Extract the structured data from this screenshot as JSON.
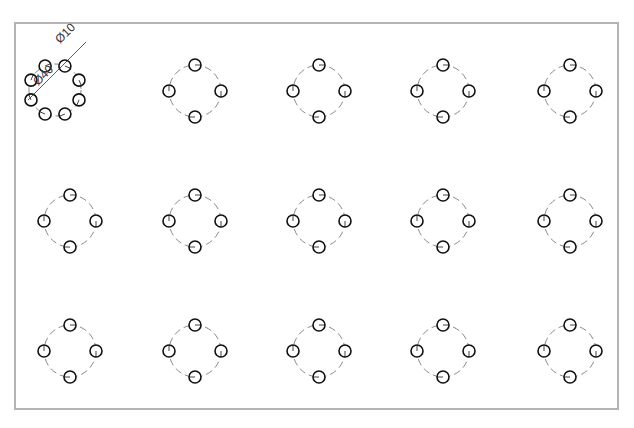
{
  "drawing": {
    "sheet": {
      "x": 15,
      "y": 23,
      "width": 603,
      "height": 386,
      "stroke": "#b4b4b4"
    },
    "colors": {
      "hole": "#111111",
      "center_line": "#8a8a8a",
      "dim": "#333333"
    },
    "detail": {
      "center": [
        55,
        90
      ],
      "bolt_circle_radius": 26,
      "hole_radius": 6,
      "hole_count": 8,
      "dimensions": [
        {
          "label": "Ø10",
          "x": 68,
          "y": 36,
          "angle": -45
        },
        {
          "label": "Ø40",
          "x": 46,
          "y": 78,
          "angle": -45
        }
      ]
    },
    "pattern": {
      "bolt_circle_radius": 26,
      "hole_radius": 6,
      "hole_count": 4,
      "columns_x": [
        70,
        195,
        319,
        443,
        570
      ],
      "rows_y": [
        91,
        221,
        351
      ],
      "skip_first": true
    }
  }
}
